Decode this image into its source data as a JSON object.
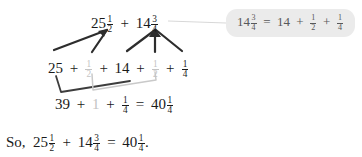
{
  "document": {
    "kind": "math-worked-example",
    "title": "Adding mixed numbers by decomposition"
  },
  "colors": {
    "text": "#1a1a1a",
    "faded_text": "#c3c3c3",
    "callout_background": "#ebebeb",
    "callout_text": "#58585a",
    "dark_connector": "#2d2d2d",
    "light_connector": "#c9c9c9"
  },
  "rows": {
    "top": {
      "label": "original expression",
      "terms": [
        {
          "whole": "25",
          "num": "1",
          "den": "2"
        },
        {
          "whole": "14",
          "num": "3",
          "den": "4"
        }
      ],
      "operator": "+"
    },
    "middle": {
      "label": "decomposed expression",
      "tokens": [
        {
          "type": "whole",
          "text": "25",
          "faded": false
        },
        {
          "type": "operator",
          "text": "+",
          "faded": false
        },
        {
          "type": "fraction",
          "num": "1",
          "den": "2",
          "faded": true
        },
        {
          "type": "operator",
          "text": "+",
          "faded": false
        },
        {
          "type": "whole",
          "text": "14",
          "faded": false
        },
        {
          "type": "operator",
          "text": "+",
          "faded": false
        },
        {
          "type": "fraction",
          "num": "1",
          "den": "2",
          "faded": true
        },
        {
          "type": "operator",
          "text": "+",
          "faded": false
        },
        {
          "type": "fraction",
          "num": "1",
          "den": "4",
          "faded": false
        }
      ]
    },
    "sum": {
      "label": "regrouped sum",
      "tokens": [
        {
          "type": "whole",
          "text": "39",
          "faded": false
        },
        {
          "type": "operator",
          "text": "+",
          "faded": false
        },
        {
          "type": "whole",
          "text": "1",
          "faded": true
        },
        {
          "type": "operator",
          "text": "+",
          "faded": false
        },
        {
          "type": "fraction",
          "num": "1",
          "den": "4",
          "faded": false
        },
        {
          "type": "operator",
          "text": "=",
          "faded": false
        },
        {
          "type": "mixed",
          "whole": "40",
          "num": "1",
          "den": "4",
          "faded": false
        }
      ]
    },
    "conclusion": {
      "label": "final statement",
      "prefix": "So,",
      "tokens": [
        {
          "type": "mixed",
          "whole": "25",
          "num": "1",
          "den": "2"
        },
        {
          "type": "operator",
          "text": "+"
        },
        {
          "type": "mixed",
          "whole": "14",
          "num": "3",
          "den": "4"
        },
        {
          "type": "operator",
          "text": "="
        },
        {
          "type": "mixed",
          "whole": "40",
          "num": "1",
          "den": "4"
        }
      ],
      "suffix": "."
    }
  },
  "callout": {
    "label": "explanation callout for 14 3/4",
    "text_parts": [
      {
        "type": "mixed",
        "whole": "14",
        "num": "3",
        "den": "4"
      },
      {
        "type": "operator",
        "text": "="
      },
      {
        "type": "whole",
        "text": "14"
      },
      {
        "type": "operator",
        "text": "+"
      },
      {
        "type": "fraction",
        "num": "1",
        "den": "2"
      },
      {
        "type": "operator",
        "text": "+"
      },
      {
        "type": "fraction",
        "num": "1",
        "den": "4"
      }
    ],
    "plain_text": "14 3/4 = 14 + 1/2 + 1/4"
  },
  "annotations": {
    "arrows_left_group": "two arrows from 25 and 1/2 up to 25 1/2",
    "arrows_right_group": "three arrows from 14, 1/2 and 1/4 up to 14 3/4",
    "bracket_dark": "joins 25 and 14 down to 39",
    "bracket_light": "joins 1/2 and 1/2 down to 1",
    "callout_leader": "line from 14 3/4 to the callout box"
  }
}
